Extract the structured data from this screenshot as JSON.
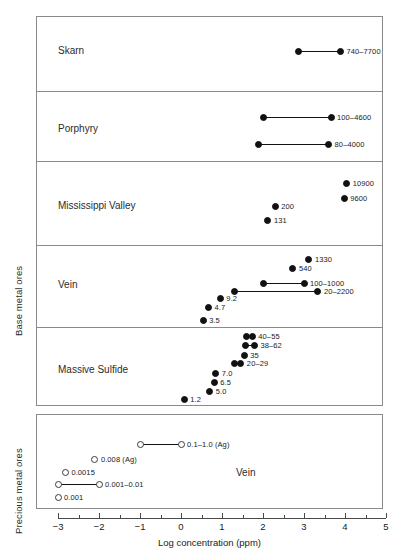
{
  "axis": {
    "y_groups": [
      {
        "id": "base",
        "label": "Base metal ores"
      },
      {
        "id": "precious",
        "label": "Precious metal ores"
      }
    ],
    "x_title": "Log concentration (ppm)",
    "x_ticks": [
      -3,
      -2,
      -1,
      0,
      1,
      2,
      3,
      4,
      5
    ],
    "x_tick_labels": [
      "−3",
      "−2",
      "−1",
      "0",
      "1",
      "2",
      "3",
      "4",
      "5"
    ],
    "x_min": -3,
    "x_max": 5
  },
  "categories": {
    "skarn": "Skarn",
    "porphyry": "Porphyry",
    "mississippi": "Mississippi Valley",
    "vein": "Vein",
    "massive": "Massive Sulfide",
    "precious_vein": "Vein"
  },
  "chart_data": {
    "type": "scatter",
    "title": "",
    "xlabel": "Log concentration (ppm)",
    "ylabel": "",
    "xlim": [
      -3,
      5
    ],
    "grid": false,
    "legend": "none",
    "note": "Dumbbell / range plot. Filled circles = base metal ores; open circles = precious metal ores. Values are concentrations in ppm; x position is log10(ppm).",
    "panels": [
      {
        "group": "Base metal ores",
        "rows": [
          {
            "category": "Skarn",
            "points": [
              {
                "label": "740–7700",
                "type": "range",
                "values": [
                  740,
                  7700
                ],
                "x": [
                  2.87,
                  3.89
                ],
                "marker": "filled"
              }
            ]
          },
          {
            "category": "Porphyry",
            "points": [
              {
                "label": "100–4600",
                "type": "range",
                "values": [
                  100,
                  4600
                ],
                "x": [
                  2.0,
                  3.66
                ],
                "marker": "filled"
              },
              {
                "label": "80–4000",
                "type": "range",
                "values": [
                  80,
                  4000
                ],
                "x": [
                  1.9,
                  3.6
                ],
                "marker": "filled"
              }
            ]
          },
          {
            "category": "Mississippi Valley",
            "points": [
              {
                "label": "10900",
                "type": "single",
                "values": [
                  10900
                ],
                "x": [
                  4.04
                ],
                "marker": "filled"
              },
              {
                "label": "9600",
                "type": "single",
                "values": [
                  9600
                ],
                "x": [
                  3.98
                ],
                "marker": "filled"
              },
              {
                "label": "200",
                "type": "single",
                "values": [
                  200
                ],
                "x": [
                  2.3
                ],
                "marker": "filled"
              },
              {
                "label": "131",
                "type": "single",
                "values": [
                  131
                ],
                "x": [
                  2.12
                ],
                "marker": "filled"
              }
            ]
          },
          {
            "category": "Vein",
            "points": [
              {
                "label": "1330",
                "type": "single",
                "values": [
                  1330
                ],
                "x": [
                  3.12
                ],
                "marker": "filled"
              },
              {
                "label": "540",
                "type": "single",
                "values": [
                  540
                ],
                "x": [
                  2.73
                ],
                "marker": "filled"
              },
              {
                "label": "100–1000",
                "type": "range",
                "values": [
                  100,
                  1000
                ],
                "x": [
                  2.0,
                  3.0
                ],
                "marker": "filled"
              },
              {
                "label": "20–2200",
                "type": "range",
                "values": [
                  20,
                  2200
                ],
                "x": [
                  1.3,
                  3.34
                ],
                "marker": "filled"
              },
              {
                "label": "9.2",
                "type": "single",
                "values": [
                  9.2
                ],
                "x": [
                  0.96
                ],
                "marker": "filled"
              },
              {
                "label": "4.7",
                "type": "single",
                "values": [
                  4.7
                ],
                "x": [
                  0.67
                ],
                "marker": "filled"
              },
              {
                "label": "3.5",
                "type": "single",
                "values": [
                  3.5
                ],
                "x": [
                  0.54
                ],
                "marker": "filled"
              }
            ]
          },
          {
            "category": "Massive Sulfide",
            "points": [
              {
                "label": "40–55",
                "type": "range",
                "values": [
                  40,
                  55
                ],
                "x": [
                  1.6,
                  1.74
                ],
                "marker": "filled"
              },
              {
                "label": "38–62",
                "type": "range",
                "values": [
                  38,
                  62
                ],
                "x": [
                  1.58,
                  1.79
                ],
                "marker": "filled"
              },
              {
                "label": "35",
                "type": "single",
                "values": [
                  35
                ],
                "x": [
                  1.54
                ],
                "marker": "filled"
              },
              {
                "label": "20–29",
                "type": "range",
                "values": [
                  20,
                  29
                ],
                "x": [
                  1.3,
                  1.46
                ],
                "marker": "filled"
              },
              {
                "label": "7.0",
                "type": "single",
                "values": [
                  7.0
                ],
                "x": [
                  0.85
                ],
                "marker": "filled"
              },
              {
                "label": "6.5",
                "type": "single",
                "values": [
                  6.5
                ],
                "x": [
                  0.81
                ],
                "marker": "filled"
              },
              {
                "label": "5.0",
                "type": "single",
                "values": [
                  5.0
                ],
                "x": [
                  0.7
                ],
                "marker": "filled"
              },
              {
                "label": "1.2",
                "type": "single",
                "values": [
                  1.2
                ],
                "x": [
                  0.08
                ],
                "marker": "filled"
              }
            ]
          }
        ]
      },
      {
        "group": "Precious metal ores",
        "rows": [
          {
            "category": "Vein",
            "points": [
              {
                "label": "0.1–1.0 (Ag)",
                "type": "range",
                "values": [
                  0.1,
                  1.0
                ],
                "x": [
                  -1.0,
                  0.0
                ],
                "marker": "open"
              },
              {
                "label": "0.008 (Ag)",
                "type": "single",
                "values": [
                  0.008
                ],
                "x": [
                  -2.1
                ],
                "marker": "open"
              },
              {
                "label": "0.0015",
                "type": "single",
                "values": [
                  0.0015
                ],
                "x": [
                  -2.82
                ],
                "marker": "open"
              },
              {
                "label": "0.001–0.01",
                "type": "range",
                "values": [
                  0.001,
                  0.01
                ],
                "x": [
                  -3.0,
                  -2.0
                ],
                "marker": "open"
              },
              {
                "label": "0.001",
                "type": "single",
                "values": [
                  0.001
                ],
                "x": [
                  -3.0
                ],
                "marker": "open"
              }
            ]
          }
        ]
      }
    ]
  },
  "marks": {
    "skarn": [
      {
        "label": "740–7700",
        "x1": 2.87,
        "x2": 3.89,
        "y": 51,
        "labelAt": 3.89,
        "marker": "filled"
      }
    ],
    "porphyry": [
      {
        "label": "100–4600",
        "x1": 2.0,
        "x2": 3.66,
        "y": 117,
        "labelAt": 3.66,
        "marker": "filled"
      },
      {
        "label": "80–4000",
        "x1": 1.9,
        "x2": 3.6,
        "y": 144,
        "labelAt": 3.6,
        "marker": "filled"
      }
    ],
    "mississippi": [
      {
        "label": "10900",
        "x1": 4.04,
        "x2": null,
        "y": 183,
        "labelAt": 4.04,
        "marker": "filled"
      },
      {
        "label": "9600",
        "x1": 3.98,
        "x2": null,
        "y": 198,
        "labelAt": 3.98,
        "marker": "filled"
      },
      {
        "label": "200",
        "x1": 2.3,
        "x2": null,
        "y": 206,
        "labelAt": 2.3,
        "marker": "filled"
      },
      {
        "label": "131",
        "x1": 2.12,
        "x2": null,
        "y": 220,
        "labelAt": 2.12,
        "marker": "filled"
      }
    ],
    "vein": [
      {
        "label": "1330",
        "x1": 3.12,
        "x2": null,
        "y": 259,
        "labelAt": 3.12,
        "marker": "filled"
      },
      {
        "label": "540",
        "x1": 2.73,
        "x2": null,
        "y": 268,
        "labelAt": 2.73,
        "marker": "filled"
      },
      {
        "label": "100–1000",
        "x1": 2.0,
        "x2": 3.0,
        "y": 283,
        "labelAt": 3.0,
        "marker": "filled"
      },
      {
        "label": "20–2200",
        "x1": 1.3,
        "x2": 3.34,
        "y": 291,
        "labelAt": 3.34,
        "marker": "filled"
      },
      {
        "label": "9.2",
        "x1": 0.96,
        "x2": null,
        "y": 298,
        "labelAt": 0.96,
        "marker": "filled"
      },
      {
        "label": "4.7",
        "x1": 0.67,
        "x2": null,
        "y": 307,
        "labelAt": 0.67,
        "marker": "filled"
      },
      {
        "label": "3.5",
        "x1": 0.54,
        "x2": null,
        "y": 320,
        "labelAt": 0.54,
        "marker": "filled"
      }
    ],
    "massive": [
      {
        "label": "40–55",
        "x1": 1.6,
        "x2": 1.74,
        "y": 336,
        "labelAt": 1.74,
        "marker": "filled"
      },
      {
        "label": "38–62",
        "x1": 1.58,
        "x2": 1.79,
        "y": 345,
        "labelAt": 1.79,
        "marker": "filled"
      },
      {
        "label": "35",
        "x1": 1.54,
        "x2": null,
        "y": 355,
        "labelAt": 1.54,
        "marker": "filled"
      },
      {
        "label": "20–29",
        "x1": 1.3,
        "x2": 1.46,
        "y": 363,
        "labelAt": 1.46,
        "marker": "filled"
      },
      {
        "label": "7.0",
        "x1": 0.85,
        "x2": null,
        "y": 373,
        "labelAt": 0.85,
        "marker": "filled"
      },
      {
        "label": "6.5",
        "x1": 0.81,
        "x2": null,
        "y": 382,
        "labelAt": 0.81,
        "marker": "filled"
      },
      {
        "label": "5.0",
        "x1": 0.7,
        "x2": null,
        "y": 391,
        "labelAt": 0.7,
        "marker": "filled"
      },
      {
        "label": "1.2",
        "x1": 0.08,
        "x2": null,
        "y": 399,
        "labelAt": 0.08,
        "marker": "filled"
      }
    ],
    "precious": [
      {
        "label": "0.1–1.0 (Ag)",
        "x1": -1.0,
        "x2": 0.0,
        "y": 444,
        "labelAt": 0.0,
        "marker": "open"
      },
      {
        "label": "0.008 (Ag)",
        "x1": -2.1,
        "x2": null,
        "y": 459,
        "labelAt": -2.1,
        "marker": "open"
      },
      {
        "label": "0.0015",
        "x1": -2.82,
        "x2": null,
        "y": 472,
        "labelAt": -2.82,
        "marker": "open"
      },
      {
        "label": "0.001–0.01",
        "x1": -3.0,
        "x2": -2.0,
        "y": 484,
        "labelAt": -2.0,
        "marker": "open"
      },
      {
        "label": "0.001",
        "x1": -3.0,
        "x2": null,
        "y": 497,
        "labelAt": -3.0,
        "marker": "open"
      }
    ]
  }
}
